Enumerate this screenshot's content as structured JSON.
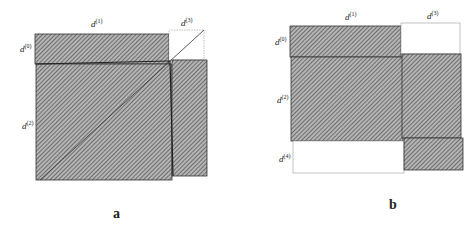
{
  "panels": [
    {
      "id": "a",
      "caption": "a",
      "labels": {
        "d0": {
          "base": "d",
          "sup": "(0)"
        },
        "d1": {
          "base": "d",
          "sup": "(1)"
        },
        "d2": {
          "base": "d",
          "sup": "(2)"
        },
        "d3": {
          "base": "d",
          "sup": "(3)"
        }
      }
    },
    {
      "id": "b",
      "caption": "b",
      "labels": {
        "d0": {
          "base": "d",
          "sup": "(0)"
        },
        "d1": {
          "base": "d",
          "sup": "(1)"
        },
        "d2": {
          "base": "d",
          "sup": "(2)"
        },
        "d3": {
          "base": "d",
          "sup": "(3)"
        },
        "d4": {
          "base": "d",
          "sup": "(4)"
        }
      }
    }
  ],
  "colors": {
    "hatch_fill": "#9a9a9a",
    "hatch_line": "#555555",
    "border": "#333333",
    "empty": "#ffffff"
  }
}
